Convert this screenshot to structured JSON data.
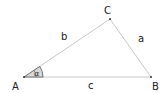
{
  "diagram": {
    "type": "triangle",
    "vertices": {
      "A": {
        "label": "A"
      },
      "B": {
        "label": "B"
      },
      "C": {
        "label": "C"
      }
    },
    "sides": {
      "a": {
        "label": "a",
        "between": [
          "B",
          "C"
        ]
      },
      "b": {
        "label": "b",
        "between": [
          "A",
          "C"
        ]
      },
      "c": {
        "label": "c",
        "between": [
          "A",
          "B"
        ]
      }
    },
    "angle_marker": {
      "vertex": "A",
      "label": "α"
    },
    "colors": {
      "edge": "#c8c8c8",
      "vertex_dot": "#333333",
      "label": "#222222",
      "angle_fill": "#d9d9d9",
      "angle_stroke": "#555555"
    }
  }
}
